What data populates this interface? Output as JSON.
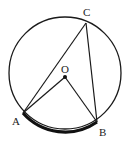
{
  "diagram": {
    "type": "geometry-circle-inscribed-angle",
    "circle": {
      "cx": 65,
      "cy": 73,
      "r": 56,
      "stroke": "#1a1a1a"
    },
    "points": {
      "O": {
        "label": "O",
        "x": 65,
        "y": 77,
        "lx": 65,
        "ly": 72
      },
      "A": {
        "label": "A",
        "x": 23,
        "y": 113,
        "lx": 17,
        "ly": 125
      },
      "B": {
        "label": "B",
        "x": 97,
        "y": 122,
        "lx": 104,
        "ly": 135
      },
      "C": {
        "label": "C",
        "x": 86,
        "y": 23,
        "lx": 88,
        "ly": 15
      }
    },
    "segments": [
      {
        "from": "A",
        "to": "C"
      },
      {
        "from": "B",
        "to": "C"
      },
      {
        "from": "A",
        "to": "O"
      },
      {
        "from": "O",
        "to": "B"
      }
    ],
    "highlighted_arc": {
      "from": "A",
      "to": "B",
      "style": "bold"
    }
  }
}
